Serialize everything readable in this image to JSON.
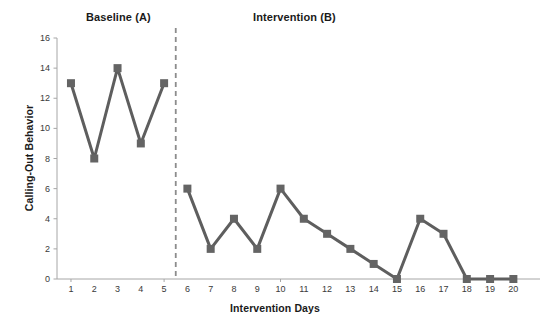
{
  "chart_data": {
    "type": "line",
    "title": "",
    "xlabel": "Intervention Days",
    "ylabel": "Calling-Out Behavior",
    "xlim": [
      0.4,
      20.8
    ],
    "ylim": [
      0,
      16
    ],
    "yticks": [
      0,
      2,
      4,
      6,
      8,
      10,
      12,
      14,
      16
    ],
    "ytick_labels": [
      "0",
      "2",
      "4",
      "6",
      "8",
      "10",
      "12",
      "14",
      "16"
    ],
    "grid": false,
    "legend": "none",
    "x": [
      1,
      2,
      3,
      4,
      5,
      6,
      7,
      8,
      9,
      10,
      11,
      12,
      13,
      14,
      15,
      16,
      17,
      18,
      19,
      20
    ],
    "xtick_labels": [
      "1",
      "2",
      "3",
      "4",
      "5",
      "6",
      "7",
      "8",
      "9",
      "10",
      "11",
      "12",
      "13",
      "14",
      "15",
      "16",
      "17",
      "18",
      "19",
      "20"
    ],
    "series": [
      {
        "name": "Baseline (A)",
        "x": [
          1,
          2,
          3,
          4,
          5
        ],
        "values": [
          13,
          8,
          14,
          9,
          13
        ],
        "color": "#5e5e5e",
        "marker": "square"
      },
      {
        "name": "Intervention (B)",
        "x": [
          6,
          7,
          8,
          9,
          10,
          11,
          12,
          13,
          14,
          15,
          16,
          17,
          18,
          19,
          20
        ],
        "values": [
          6,
          2,
          4,
          2,
          6,
          4,
          3,
          2,
          1,
          0,
          4,
          3,
          0,
          0,
          0
        ],
        "color": "#5e5e5e",
        "marker": "square"
      }
    ],
    "annotations": [
      {
        "name": "phase-label-a",
        "text": "Baseline (A)"
      },
      {
        "name": "phase-label-b",
        "text": "Intervention (B)"
      },
      {
        "name": "phase-change-line",
        "x": 5.5,
        "style": "dashed"
      }
    ],
    "colors": {
      "line": "#5e5e5e",
      "marker": "#646464",
      "axis": "#a6a6a6",
      "phase_line": "#8c8c8c",
      "text": "#1a1a1a",
      "tick_text": "#3a3a3a",
      "background": "#ffffff"
    }
  }
}
